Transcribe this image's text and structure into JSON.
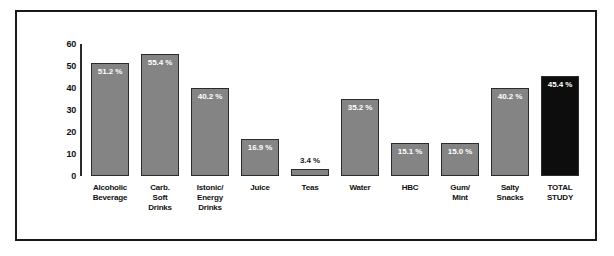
{
  "chart_data": {
    "type": "bar",
    "title": "",
    "subtitle": "",
    "xlabel": "",
    "ylabel": "",
    "ylim": [
      0,
      60
    ],
    "yticks": [
      60,
      50,
      40,
      30,
      20,
      10,
      0
    ],
    "grid": false,
    "legend": null,
    "categories": [
      "Alcoholic Beverage",
      "Carb. Soft Drinks",
      "Istonic/ Energy Drinks",
      "Juice",
      "Teas",
      "Water",
      "HBC",
      "Gum/ Mint",
      "Salty Snacks",
      "TOTAL STUDY"
    ],
    "values": [
      51.2,
      55.4,
      40.2,
      16.9,
      3.4,
      35.2,
      15.1,
      15.0,
      40.2,
      45.4
    ],
    "data_labels": [
      "51.2 %",
      "55.4 %",
      "40.2 %",
      "16.9 %",
      "3.4 %",
      "35.2 %",
      "15.1 %",
      "15.0 %",
      "40.2 %",
      "45.4 %"
    ],
    "colors": {
      "bar_fill": "#848484",
      "bar_fill_highlight": "#0d0d0d",
      "bar_border": "#2b2b2b",
      "axis": "#2a2a2a",
      "frame": "#1a1a1a",
      "label_on_bar": "#ffffff",
      "label_off_bar": "#1a1a1a",
      "background": "#ffffff"
    }
  },
  "bars": [
    {
      "label": "51.2 %",
      "value": 51.2,
      "highlight": false,
      "label_outside": false,
      "caption_lines": [
        "Alcoholic",
        "Beverage"
      ]
    },
    {
      "label": "55.4 %",
      "value": 55.4,
      "highlight": false,
      "label_outside": false,
      "caption_lines": [
        "Carb.",
        "Soft",
        "Drinks"
      ]
    },
    {
      "label": "40.2 %",
      "value": 40.2,
      "highlight": false,
      "label_outside": false,
      "caption_lines": [
        "Istonic/",
        "Energy",
        "Drinks"
      ]
    },
    {
      "label": "16.9 %",
      "value": 16.9,
      "highlight": false,
      "label_outside": false,
      "caption_lines": [
        "Juice"
      ]
    },
    {
      "label": "3.4 %",
      "value": 3.4,
      "highlight": false,
      "label_outside": true,
      "caption_lines": [
        "Teas"
      ]
    },
    {
      "label": "35.2 %",
      "value": 35.2,
      "highlight": false,
      "label_outside": false,
      "caption_lines": [
        "Water"
      ]
    },
    {
      "label": "15.1 %",
      "value": 15.1,
      "highlight": false,
      "label_outside": false,
      "caption_lines": [
        "HBC"
      ]
    },
    {
      "label": "15.0 %",
      "value": 15.0,
      "highlight": false,
      "label_outside": false,
      "caption_lines": [
        "Gum/",
        "Mint"
      ]
    },
    {
      "label": "40.2 %",
      "value": 40.2,
      "highlight": false,
      "label_outside": false,
      "caption_lines": [
        "Salty",
        "Snacks"
      ]
    },
    {
      "label": "45.4 %",
      "value": 45.4,
      "highlight": true,
      "label_outside": false,
      "caption_lines": [
        "TOTAL",
        "STUDY"
      ]
    }
  ],
  "y_axis": {
    "ticks": [
      "60",
      "50",
      "40",
      "30",
      "20",
      "10",
      "0"
    ],
    "max": 60,
    "min": 0
  }
}
